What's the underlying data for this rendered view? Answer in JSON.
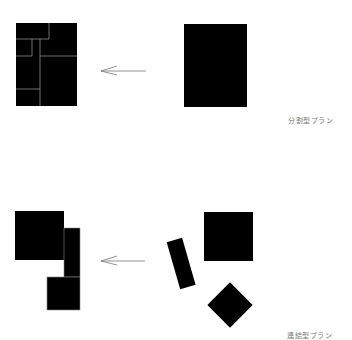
{
  "diagram": {
    "top_row": {
      "label": "分割型プラン",
      "arrow_direction": "left"
    },
    "bottom_row": {
      "label": "連結型プラン",
      "arrow_direction": "left"
    },
    "colors": {
      "fill": "#000000",
      "divider": "#888888",
      "arrow": "#777777",
      "label": "#777777"
    }
  }
}
